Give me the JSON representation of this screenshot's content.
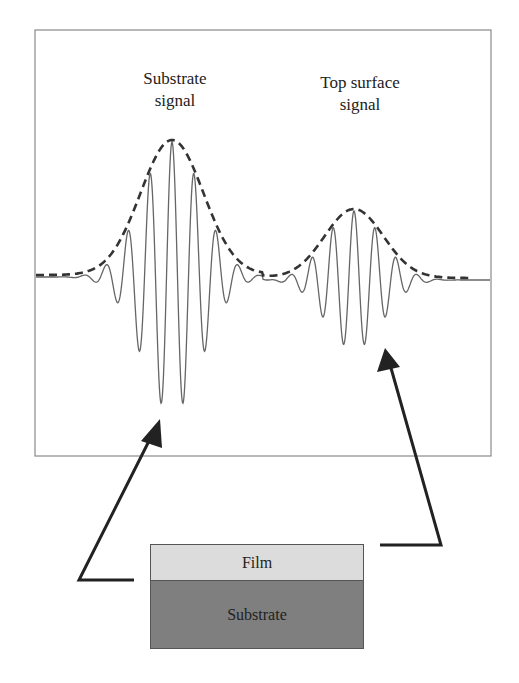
{
  "figure": {
    "labels": {
      "substrate_signal": [
        "Substrate",
        "signal"
      ],
      "top_surface_signal": [
        "Top surface",
        "signal"
      ]
    },
    "layers": {
      "film": "Film",
      "substrate": "Substrate"
    },
    "colors": {
      "frame": "#888888",
      "waveform": "#666666",
      "envelope": "#333333",
      "arrow": "#222222",
      "film_fill": "#dcdcdc",
      "substrate_fill": "#7f7f7f"
    }
  },
  "chart_data": {
    "type": "line",
    "title": "",
    "xlabel": "",
    "ylabel": "",
    "grid": false,
    "series": [
      {
        "name": "Substrate signal",
        "kind": "gaussian wave packet",
        "center_x_px": 172,
        "peak_amplitude": 1.0,
        "envelope": "dashed"
      },
      {
        "name": "Top surface signal",
        "kind": "gaussian wave packet",
        "center_x_px": 354,
        "peak_amplitude": 0.51,
        "envelope": "dashed"
      }
    ],
    "annotations": [
      "Substrate signal",
      "Top surface signal",
      "Film",
      "Substrate"
    ]
  }
}
